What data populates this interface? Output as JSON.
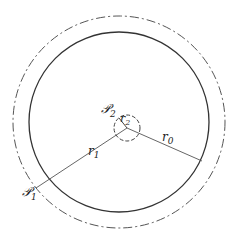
{
  "diagram": {
    "labels": {
      "p1": "𝒫",
      "p1_sub": "1",
      "p2": "𝒫",
      "p2_sub": "2",
      "r0": "r",
      "r0_sub": "0",
      "r1": "r",
      "r1_sub": "1",
      "r2": "r",
      "r2_sub": "2"
    },
    "colors": {
      "stroke": "#333333",
      "dashed": "#555555",
      "background": "#ffffff"
    }
  }
}
